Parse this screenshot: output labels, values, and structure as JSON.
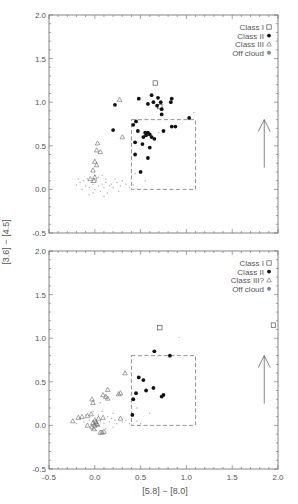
{
  "figure": {
    "xlabel": "[5.8] − [8.0]",
    "ylabel": "[3.6] − [4.5]"
  },
  "chart_data": [
    {
      "type": "scatter",
      "panel": "top",
      "xlabel": "[5.8] - [8.0]",
      "ylabel": "[3.6] - [4.5]",
      "xlim": [
        -0.5,
        2.0
      ],
      "ylim": [
        -0.5,
        2.0
      ],
      "xticks": [
        "-0.5",
        "0.0",
        "0.5",
        "1.0",
        "1.5",
        "2.0"
      ],
      "yticks": [
        "-0.5",
        "0.0",
        "0.5",
        "1.0",
        "1.5",
        "2.0"
      ],
      "grid": false,
      "legend_position": "upper right",
      "legend": [
        "Class I",
        "Class II",
        "Class III",
        "Off cloud"
      ],
      "box": {
        "x0": 0.4,
        "x1": 1.1,
        "y0": 0.0,
        "y1": 0.8
      },
      "arrow": {
        "x": 1.85,
        "y_start": 0.25,
        "y_end": 0.8
      },
      "series": [
        {
          "name": "Class I",
          "marker": "square-open",
          "points": [
            [
              0.66,
              1.22
            ],
            [
              0.71,
              0.95
            ]
          ]
        },
        {
          "name": "Class II",
          "marker": "circle-filled",
          "points": [
            [
              0.22,
              0.97
            ],
            [
              0.45,
              0.78
            ],
            [
              0.42,
              0.74
            ],
            [
              0.47,
              0.67
            ],
            [
              0.55,
              0.65
            ],
            [
              0.58,
              0.65
            ],
            [
              0.6,
              0.63
            ],
            [
              0.53,
              0.6
            ],
            [
              0.56,
              0.62
            ],
            [
              0.62,
              0.6
            ],
            [
              0.65,
              0.58
            ],
            [
              0.52,
              0.52
            ],
            [
              0.44,
              0.54
            ],
            [
              0.44,
              0.4
            ],
            [
              0.6,
              0.48
            ],
            [
              0.58,
              0.36
            ],
            [
              0.5,
              0.2
            ],
            [
              0.75,
              0.67
            ],
            [
              0.84,
              0.72
            ],
            [
              0.88,
              0.72
            ],
            [
              1.03,
              0.82
            ],
            [
              0.62,
              1.08
            ],
            [
              0.69,
              1.05
            ],
            [
              0.64,
              1.0
            ],
            [
              0.72,
              1.0
            ],
            [
              0.68,
              0.96
            ],
            [
              0.73,
              0.92
            ],
            [
              0.73,
              0.86
            ],
            [
              0.83,
              1.0
            ],
            [
              0.84,
              1.04
            ],
            [
              0.2,
              0.68
            ],
            [
              0.58,
              0.98
            ],
            [
              0.48,
              1.04
            ]
          ]
        },
        {
          "name": "Class III",
          "marker": "triangle-open",
          "points": [
            [
              0.27,
              1.03
            ],
            [
              0.3,
              0.6
            ],
            [
              0.03,
              0.53
            ],
            [
              0.02,
              0.45
            ],
            [
              0.06,
              0.43
            ],
            [
              0.0,
              0.32
            ],
            [
              0.02,
              0.28
            ],
            [
              -0.02,
              0.22
            ],
            [
              -0.05,
              0.12
            ],
            [
              0.0,
              0.14
            ],
            [
              -0.01,
              0.1
            ]
          ]
        },
        {
          "name": "Off cloud",
          "marker": "dot-gray",
          "points": [
            [
              -0.2,
              0.05
            ],
            [
              -0.16,
              0.08
            ],
            [
              -0.12,
              0.1
            ],
            [
              -0.1,
              0.04
            ],
            [
              -0.08,
              0.12
            ],
            [
              -0.06,
              0.02
            ],
            [
              -0.04,
              0.08
            ],
            [
              -0.02,
              0.06
            ],
            [
              0.0,
              0.0
            ],
            [
              0.02,
              0.1
            ],
            [
              0.04,
              0.04
            ],
            [
              0.06,
              -0.02
            ],
            [
              0.08,
              0.06
            ],
            [
              0.1,
              0.02
            ],
            [
              0.12,
              0.08
            ],
            [
              0.14,
              -0.04
            ],
            [
              0.16,
              0.04
            ],
            [
              0.18,
              0.06
            ],
            [
              0.2,
              0.02
            ],
            [
              0.24,
              0.08
            ],
            [
              0.28,
              0.04
            ],
            [
              0.3,
              0.1
            ],
            [
              0.34,
              0.06
            ],
            [
              0.38,
              0.02
            ],
            [
              -0.14,
              0.0
            ],
            [
              -0.18,
              0.12
            ],
            [
              -0.02,
              -0.04
            ],
            [
              0.04,
              0.14
            ],
            [
              0.1,
              -0.08
            ],
            [
              0.22,
              0.12
            ],
            [
              0.44,
              0.18
            ],
            [
              0.55,
              0.1
            ],
            [
              0.42,
              0.05
            ],
            [
              0.7,
              0.65
            ],
            [
              1.08,
              0.88
            ],
            [
              0.08,
              0.16
            ],
            [
              -0.06,
              -0.06
            ],
            [
              0.0,
              0.16
            ],
            [
              0.12,
              0.12
            ],
            [
              0.26,
              -0.02
            ]
          ]
        }
      ]
    },
    {
      "type": "scatter",
      "panel": "bottom",
      "xlabel": "[5.8] - [8.0]",
      "ylabel": "[3.6] - [4.5]",
      "xlim": [
        -0.5,
        2.0
      ],
      "ylim": [
        -0.5,
        2.0
      ],
      "xticks": [
        "-0.5",
        "0.0",
        "0.5",
        "1.0",
        "1.5",
        "2.0"
      ],
      "yticks": [
        "-0.5",
        "0.0",
        "0.5",
        "1.0",
        "1.5",
        "2.0"
      ],
      "grid": false,
      "legend_position": "upper right",
      "legend": [
        "Class I",
        "Class II",
        "Class III?",
        "Off cloud"
      ],
      "box": {
        "x0": 0.4,
        "x1": 1.1,
        "y0": 0.0,
        "y1": 0.8
      },
      "arrow": {
        "x": 1.85,
        "y_start": 0.25,
        "y_end": 0.8
      },
      "series": [
        {
          "name": "Class I",
          "marker": "square-open",
          "points": [
            [
              0.71,
              1.12
            ],
            [
              1.95,
              1.15
            ]
          ]
        },
        {
          "name": "Class II",
          "marker": "circle-filled",
          "points": [
            [
              0.65,
              0.85
            ],
            [
              0.82,
              0.8
            ],
            [
              0.48,
              0.55
            ],
            [
              0.45,
              0.37
            ],
            [
              0.56,
              0.4
            ],
            [
              0.64,
              0.43
            ],
            [
              0.42,
              0.3
            ],
            [
              0.41,
              0.12
            ],
            [
              0.73,
              0.33
            ],
            [
              0.75,
              0.35
            ],
            [
              0.53,
              0.52
            ]
          ]
        },
        {
          "name": "Class III?",
          "marker": "triangle-open",
          "points": [
            [
              0.33,
              0.6
            ],
            [
              0.28,
              0.37
            ],
            [
              0.14,
              0.41
            ],
            [
              0.09,
              0.35
            ],
            [
              0.12,
              0.33
            ],
            [
              0.14,
              0.31
            ],
            [
              -0.03,
              0.3
            ],
            [
              -0.02,
              0.26
            ],
            [
              0.09,
              0.09
            ],
            [
              -0.24,
              0.05
            ],
            [
              -0.18,
              0.09
            ],
            [
              -0.14,
              0.1
            ],
            [
              -0.08,
              0.11
            ],
            [
              -0.04,
              0.13
            ],
            [
              -0.02,
              0.03
            ],
            [
              0.0,
              0.06
            ],
            [
              0.01,
              0.04
            ],
            [
              0.02,
              0.02
            ],
            [
              0.0,
              0.0
            ],
            [
              0.03,
              0.01
            ],
            [
              -0.03,
              -0.02
            ],
            [
              -0.01,
              -0.04
            ],
            [
              0.06,
              -0.08
            ],
            [
              0.08,
              -0.08
            ],
            [
              0.1,
              -0.07
            ],
            [
              -0.08,
              0.0
            ],
            [
              0.04,
              0.08
            ],
            [
              0.28,
              0.08
            ],
            [
              0.26,
              0.36
            ]
          ]
        },
        {
          "name": "Off cloud",
          "marker": "dot-gray",
          "points": [
            [
              -0.2,
              0.02
            ],
            [
              -0.16,
              0.08
            ],
            [
              -0.12,
              0.04
            ],
            [
              -0.1,
              0.12
            ],
            [
              -0.06,
              0.06
            ],
            [
              -0.04,
              0.0
            ],
            [
              0.04,
              0.12
            ],
            [
              0.06,
              0.04
            ],
            [
              0.1,
              0.02
            ],
            [
              0.14,
              0.1
            ],
            [
              0.16,
              0.04
            ],
            [
              0.18,
              0.08
            ],
            [
              0.2,
              -0.02
            ],
            [
              0.22,
              0.06
            ],
            [
              0.24,
              0.02
            ],
            [
              0.3,
              0.04
            ],
            [
              0.34,
              0.06
            ],
            [
              0.38,
              0.02
            ],
            [
              0.46,
              0.2
            ],
            [
              0.46,
              0.05
            ],
            [
              0.6,
              0.14
            ],
            [
              0.92,
              1.01
            ],
            [
              0.12,
              -0.04
            ],
            [
              -0.02,
              0.16
            ],
            [
              0.08,
              0.16
            ],
            [
              0.02,
              -0.06
            ],
            [
              0.2,
              0.14
            ],
            [
              0.06,
              0.26
            ],
            [
              0.5,
              0.02
            ]
          ]
        }
      ]
    }
  ]
}
